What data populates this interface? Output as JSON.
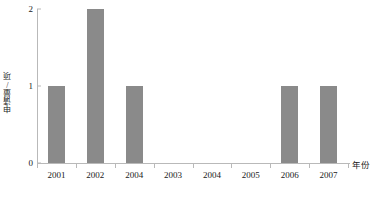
{
  "chart_data": {
    "type": "bar",
    "title": "",
    "subtitle": "",
    "xlabel": "年份",
    "ylabel": "申请量/项",
    "categories": [
      "2001",
      "2002",
      "2004",
      "2003",
      "2004",
      "2005",
      "2006",
      "2007"
    ],
    "values": [
      1,
      2,
      1,
      0,
      0,
      0,
      1,
      1
    ],
    "ylim": [
      0,
      2
    ],
    "yticks": [
      "0",
      "1",
      "2"
    ],
    "ytick_values": [
      0,
      1,
      2
    ],
    "grid": false,
    "legend": null,
    "bar_color": "#8a8a8a",
    "axis_color": "#b9b9b9",
    "text_color": "#1a1a1a"
  }
}
